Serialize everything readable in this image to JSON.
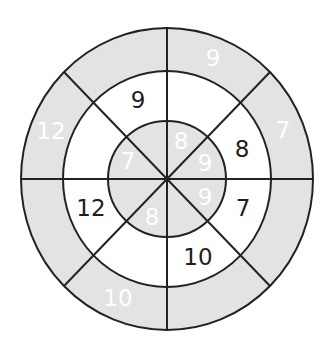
{
  "diagram": {
    "type": "number-wheel-puzzle",
    "center": {
      "x": 167,
      "y": 179
    },
    "radii": {
      "outer": {
        "rx": 146,
        "ry": 151
      },
      "middle": {
        "rx": 104,
        "ry": 108
      },
      "inner": {
        "rx": 59,
        "ry": 58
      }
    },
    "sectors": 8,
    "colors": {
      "shaded_fill": "#e3e3e3",
      "white_fill": "#ffffff",
      "line": "#222222",
      "dark_text": "#1e1e1e",
      "light_text": "#ffffff"
    },
    "outer_ring": {
      "fill": "shaded",
      "text_color": "light",
      "cells": [
        {
          "sector": "N-NE",
          "value": "9",
          "x": 213,
          "y": 58
        },
        {
          "sector": "NE-E",
          "value": "7",
          "x": 283,
          "y": 130
        },
        {
          "sector": "E-SE",
          "value": "",
          "x": 283,
          "y": 228
        },
        {
          "sector": "SE-S",
          "value": "",
          "x": 213,
          "y": 300
        },
        {
          "sector": "S-SW",
          "value": "10",
          "x": 118,
          "y": 298
        },
        {
          "sector": "SW-W",
          "value": "",
          "x": 51,
          "y": 228
        },
        {
          "sector": "W-NW",
          "value": "12",
          "x": 51,
          "y": 131
        },
        {
          "sector": "NW-N",
          "value": "",
          "x": 121,
          "y": 58
        }
      ]
    },
    "middle_ring": {
      "fill": "white",
      "text_color": "dark",
      "cells": [
        {
          "sector": "N-NE",
          "value": "",
          "x": 196,
          "y": 100
        },
        {
          "sector": "NE-E",
          "value": "8",
          "x": 242,
          "y": 149
        },
        {
          "sector": "E-SE",
          "value": "7",
          "x": 243,
          "y": 208
        },
        {
          "sector": "SE-S",
          "value": "10",
          "x": 198,
          "y": 257
        },
        {
          "sector": "S-SW",
          "value": "",
          "x": 138,
          "y": 257
        },
        {
          "sector": "SW-W",
          "value": "12",
          "x": 91,
          "y": 208
        },
        {
          "sector": "W-NW",
          "value": "",
          "x": 91,
          "y": 149
        },
        {
          "sector": "NW-N",
          "value": "9",
          "x": 138,
          "y": 100
        }
      ]
    },
    "inner_circle": {
      "fill": "shaded",
      "text_color": "light",
      "cells": [
        {
          "sector": "N-NE",
          "value": "8",
          "x": 181,
          "y": 141
        },
        {
          "sector": "NE-E",
          "value": "9",
          "x": 205,
          "y": 163
        },
        {
          "sector": "E-SE",
          "value": "9",
          "x": 205,
          "y": 197
        },
        {
          "sector": "SE-S",
          "value": "",
          "x": 183,
          "y": 217
        },
        {
          "sector": "S-SW",
          "value": "8",
          "x": 152,
          "y": 217
        },
        {
          "sector": "SW-W",
          "value": "",
          "x": 128,
          "y": 197
        },
        {
          "sector": "W-NW",
          "value": "7",
          "x": 128,
          "y": 161
        },
        {
          "sector": "NW-N",
          "value": "",
          "x": 152,
          "y": 141
        }
      ]
    }
  }
}
